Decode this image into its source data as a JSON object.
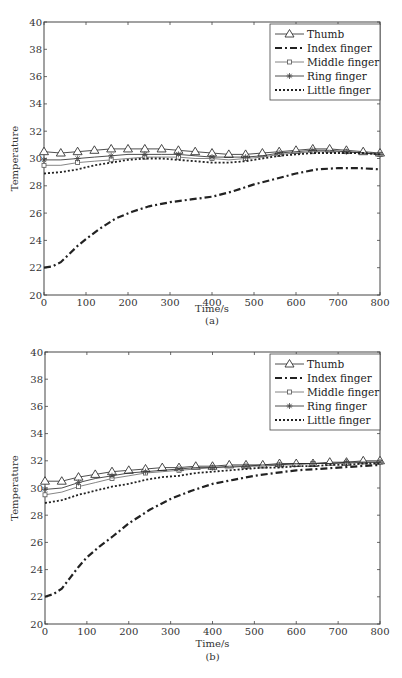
{
  "figure": {
    "panels": [
      {
        "caption": "(a)",
        "xlabel": "Time/s",
        "ylabel": "Temperature"
      },
      {
        "caption": "(b)",
        "xlabel": "Time/s",
        "ylabel": "Temperature"
      }
    ]
  },
  "chart_data": [
    {
      "type": "line",
      "title": "",
      "caption": "(a)",
      "xlabel": "Time/s",
      "ylabel": "Temperature",
      "xlim": [
        0,
        800
      ],
      "ylim": [
        20,
        40
      ],
      "xticks": [
        0,
        100,
        200,
        300,
        400,
        500,
        600,
        700,
        800
      ],
      "yticks": [
        20,
        22,
        24,
        26,
        28,
        30,
        32,
        34,
        36,
        38,
        40
      ],
      "grid": false,
      "legend_position": "upper right",
      "series": [
        {
          "name": "Thumb",
          "style": "solid-triangle",
          "x": [
            0,
            40,
            80,
            120,
            160,
            200,
            240,
            280,
            320,
            360,
            400,
            440,
            480,
            520,
            560,
            600,
            640,
            680,
            720,
            760,
            800
          ],
          "values": [
            30.5,
            30.4,
            30.5,
            30.6,
            30.7,
            30.7,
            30.7,
            30.7,
            30.6,
            30.5,
            30.4,
            30.3,
            30.3,
            30.4,
            30.5,
            30.6,
            30.7,
            30.7,
            30.6,
            30.5,
            30.4
          ]
        },
        {
          "name": "Index finger",
          "style": "dash-dot",
          "x": [
            0,
            20,
            40,
            60,
            80,
            100,
            130,
            170,
            210,
            250,
            300,
            350,
            400,
            450,
            500,
            550,
            600,
            650,
            700,
            750,
            800
          ],
          "values": [
            22.0,
            22.1,
            22.4,
            23.0,
            23.6,
            24.1,
            24.8,
            25.6,
            26.1,
            26.5,
            26.8,
            27.0,
            27.2,
            27.6,
            28.1,
            28.5,
            28.9,
            29.2,
            29.3,
            29.3,
            29.2
          ]
        },
        {
          "name": "Middle finger",
          "style": "solid-square",
          "x": [
            0,
            40,
            80,
            120,
            160,
            200,
            240,
            280,
            320,
            360,
            400,
            440,
            480,
            520,
            560,
            600,
            640,
            680,
            720,
            760,
            800
          ],
          "values": [
            29.5,
            29.5,
            29.7,
            29.8,
            29.9,
            30.0,
            30.1,
            30.1,
            30.1,
            30.0,
            30.0,
            29.9,
            30.0,
            30.1,
            30.3,
            30.4,
            30.5,
            30.5,
            30.5,
            30.4,
            30.3
          ]
        },
        {
          "name": "Ring finger",
          "style": "solid-star",
          "x": [
            0,
            40,
            80,
            120,
            160,
            200,
            240,
            280,
            320,
            360,
            400,
            440,
            480,
            520,
            560,
            600,
            640,
            680,
            720,
            760,
            800
          ],
          "values": [
            29.9,
            29.9,
            30.0,
            30.1,
            30.2,
            30.3,
            30.3,
            30.3,
            30.3,
            30.2,
            30.1,
            30.1,
            30.1,
            30.2,
            30.4,
            30.5,
            30.6,
            30.6,
            30.5,
            30.4,
            30.3
          ]
        },
        {
          "name": "Little finger",
          "style": "dotted",
          "x": [
            0,
            40,
            80,
            120,
            160,
            200,
            240,
            280,
            320,
            360,
            400,
            440,
            480,
            520,
            560,
            600,
            640,
            680,
            720,
            760,
            800
          ],
          "values": [
            28.9,
            29.0,
            29.2,
            29.5,
            29.7,
            29.9,
            30.0,
            30.0,
            29.9,
            29.8,
            29.7,
            29.7,
            29.8,
            30.0,
            30.2,
            30.3,
            30.4,
            30.4,
            30.4,
            30.4,
            30.3
          ]
        }
      ]
    },
    {
      "type": "line",
      "title": "",
      "caption": "(b)",
      "xlabel": "Time/s",
      "ylabel": "Temperature",
      "xlim": [
        0,
        800
      ],
      "ylim": [
        20,
        40
      ],
      "xticks": [
        0,
        100,
        200,
        300,
        400,
        500,
        600,
        700,
        800
      ],
      "yticks": [
        20,
        22,
        24,
        26,
        28,
        30,
        32,
        34,
        36,
        38,
        40
      ],
      "grid": false,
      "legend_position": "upper right",
      "series": [
        {
          "name": "Thumb",
          "style": "solid-triangle",
          "x": [
            0,
            40,
            80,
            120,
            160,
            200,
            240,
            280,
            320,
            360,
            400,
            440,
            480,
            520,
            560,
            600,
            640,
            680,
            720,
            760,
            800
          ],
          "values": [
            30.5,
            30.5,
            30.8,
            31.0,
            31.2,
            31.3,
            31.4,
            31.5,
            31.5,
            31.6,
            31.6,
            31.7,
            31.7,
            31.7,
            31.8,
            31.8,
            31.8,
            31.9,
            31.9,
            32.0,
            32.0
          ]
        },
        {
          "name": "Index finger",
          "style": "dash-dot",
          "x": [
            0,
            20,
            40,
            60,
            80,
            100,
            130,
            160,
            200,
            250,
            300,
            350,
            400,
            450,
            500,
            550,
            600,
            650,
            700,
            750,
            800
          ],
          "values": [
            22.0,
            22.2,
            22.6,
            23.4,
            24.2,
            24.9,
            25.7,
            26.4,
            27.4,
            28.4,
            29.2,
            29.8,
            30.3,
            30.6,
            30.9,
            31.1,
            31.3,
            31.4,
            31.5,
            31.6,
            31.7
          ]
        },
        {
          "name": "Middle finger",
          "style": "solid-square",
          "x": [
            0,
            40,
            80,
            120,
            160,
            200,
            240,
            280,
            320,
            360,
            400,
            440,
            480,
            520,
            560,
            600,
            640,
            680,
            720,
            760,
            800
          ],
          "values": [
            29.5,
            29.7,
            30.1,
            30.4,
            30.7,
            30.9,
            31.1,
            31.2,
            31.3,
            31.4,
            31.5,
            31.5,
            31.6,
            31.6,
            31.7,
            31.7,
            31.8,
            31.8,
            31.8,
            31.9,
            31.9
          ]
        },
        {
          "name": "Ring finger",
          "style": "solid-star",
          "x": [
            0,
            40,
            80,
            120,
            160,
            200,
            240,
            280,
            320,
            360,
            400,
            440,
            480,
            520,
            560,
            600,
            640,
            680,
            720,
            760,
            800
          ],
          "values": [
            29.9,
            30.0,
            30.4,
            30.7,
            30.9,
            31.1,
            31.2,
            31.3,
            31.4,
            31.5,
            31.5,
            31.6,
            31.6,
            31.7,
            31.7,
            31.8,
            31.8,
            31.8,
            31.9,
            31.9,
            31.9
          ]
        },
        {
          "name": "Little finger",
          "style": "dotted",
          "x": [
            0,
            40,
            80,
            120,
            160,
            200,
            240,
            280,
            320,
            360,
            400,
            440,
            480,
            520,
            560,
            600,
            640,
            680,
            720,
            760,
            800
          ],
          "values": [
            28.9,
            29.1,
            29.5,
            29.8,
            30.1,
            30.3,
            30.6,
            30.8,
            30.9,
            31.1,
            31.2,
            31.3,
            31.4,
            31.5,
            31.5,
            31.6,
            31.6,
            31.7,
            31.7,
            31.8,
            31.8
          ]
        }
      ]
    }
  ]
}
